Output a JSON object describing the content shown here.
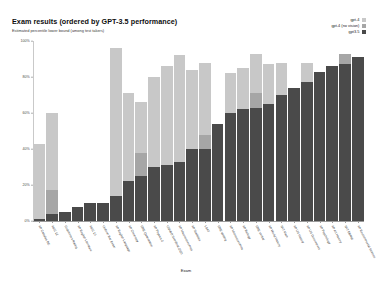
{
  "chart": {
    "title": "Exam results (ordered by GPT-3.5 performance)",
    "subtitle": "Estimated percentile lower bound (among test takers)",
    "xaxis_title": "Exam"
  },
  "legend": {
    "items": [
      {
        "label": "gpt-4",
        "color": "#c8c8c8",
        "swatch_name": "legend-swatch-gpt4"
      },
      {
        "label": "gpt-4 (no vision)",
        "color": "#a6a6a6",
        "swatch_name": "legend-swatch-gpt4-no-vision"
      },
      {
        "label": "gpt3.5",
        "color": "#4a4a4a",
        "swatch_name": "legend-swatch-gpt35"
      }
    ]
  },
  "chart_data": {
    "type": "bar",
    "subtype": "stacked",
    "title": "Exam results (ordered by GPT-3.5 performance)",
    "subtitle": "Estimated percentile lower bound (among test takers)",
    "xlabel": "Exam",
    "ylabel": "",
    "ylim": [
      0,
      100
    ],
    "ytick_labels": [
      "0%",
      "20%",
      "40%",
      "60%",
      "80%",
      "100%"
    ],
    "ytick_values": [
      0,
      20,
      40,
      60,
      80,
      100
    ],
    "grid": false,
    "legend_position": "top-right",
    "colors": {
      "gpt-4": "#c8c8c8",
      "gpt-4 (no vision)": "#a6a6a6",
      "gpt3.5": "#4a4a4a"
    },
    "categories": [
      "AP Calculus BC",
      "AMC 12",
      "Codeforces Rating",
      "AP English Literature",
      "AMC 10",
      "Uniform Bar Exam",
      "AP English Language",
      "AP Chemistry",
      "GRE Quantitative",
      "AP Physics 2",
      "USABO Semifinal 2020",
      "AP Macroeconomics",
      "AP Statistics",
      "LSAT",
      "GRE Writing",
      "AP Microeconomics",
      "AP Biology",
      "GRE Verbal",
      "AP World History",
      "SAT Math",
      "AP US History",
      "AP US Government",
      "AP Psychology",
      "AP Art History",
      "SAT EBRW",
      "AP Environmental Science"
    ],
    "series": [
      {
        "name": "gpt3.5",
        "values": [
          1,
          4,
          5,
          8,
          10,
          10,
          14,
          22,
          25,
          30,
          31,
          33,
          40,
          40,
          54,
          60,
          62,
          63,
          65,
          70,
          74,
          77,
          83,
          86,
          87,
          91
        ]
      },
      {
        "name": "gpt-4 (no vision)",
        "values": [
          43,
          60,
          5,
          8,
          10,
          10,
          14,
          22,
          66,
          30,
          31,
          33,
          40,
          40,
          54,
          60,
          62,
          63,
          65,
          70,
          74,
          77,
          83,
          86,
          87,
          91
        ]
      },
      {
        "name": "gpt-4",
        "values": [
          43,
          60,
          5,
          8,
          10,
          10,
          96,
          71,
          66,
          80,
          86,
          92,
          84,
          88,
          54,
          82,
          85,
          93,
          87,
          88,
          74,
          88,
          83,
          86,
          93,
          91
        ]
      }
    ],
    "stack_segments": [
      {
        "gpt35": 1,
        "no_vision": 0,
        "vision": 42
      },
      {
        "gpt35": 4,
        "no_vision": 13,
        "vision": 43
      },
      {
        "gpt35": 5,
        "no_vision": 0,
        "vision": 0
      },
      {
        "gpt35": 8,
        "no_vision": 0,
        "vision": 0
      },
      {
        "gpt35": 10,
        "no_vision": 0,
        "vision": 0
      },
      {
        "gpt35": 10,
        "no_vision": 0,
        "vision": 0
      },
      {
        "gpt35": 14,
        "no_vision": 0,
        "vision": 82
      },
      {
        "gpt35": 22,
        "no_vision": 0,
        "vision": 49
      },
      {
        "gpt35": 25,
        "no_vision": 13,
        "vision": 28
      },
      {
        "gpt35": 30,
        "no_vision": 0,
        "vision": 50
      },
      {
        "gpt35": 31,
        "no_vision": 0,
        "vision": 55
      },
      {
        "gpt35": 33,
        "no_vision": 0,
        "vision": 59
      },
      {
        "gpt35": 40,
        "no_vision": 0,
        "vision": 44
      },
      {
        "gpt35": 40,
        "no_vision": 8,
        "vision": 40
      },
      {
        "gpt35": 54,
        "no_vision": 0,
        "vision": 0
      },
      {
        "gpt35": 60,
        "no_vision": 0,
        "vision": 22
      },
      {
        "gpt35": 62,
        "no_vision": 0,
        "vision": 23
      },
      {
        "gpt35": 63,
        "no_vision": 8,
        "vision": 22
      },
      {
        "gpt35": 65,
        "no_vision": 0,
        "vision": 22
      },
      {
        "gpt35": 70,
        "no_vision": 0,
        "vision": 18
      },
      {
        "gpt35": 74,
        "no_vision": 0,
        "vision": 0
      },
      {
        "gpt35": 77,
        "no_vision": 0,
        "vision": 11
      },
      {
        "gpt35": 83,
        "no_vision": 0,
        "vision": 0
      },
      {
        "gpt35": 86,
        "no_vision": 0,
        "vision": 0
      },
      {
        "gpt35": 87,
        "no_vision": 6,
        "vision": 0
      },
      {
        "gpt35": 91,
        "no_vision": 0,
        "vision": 0
      }
    ]
  }
}
